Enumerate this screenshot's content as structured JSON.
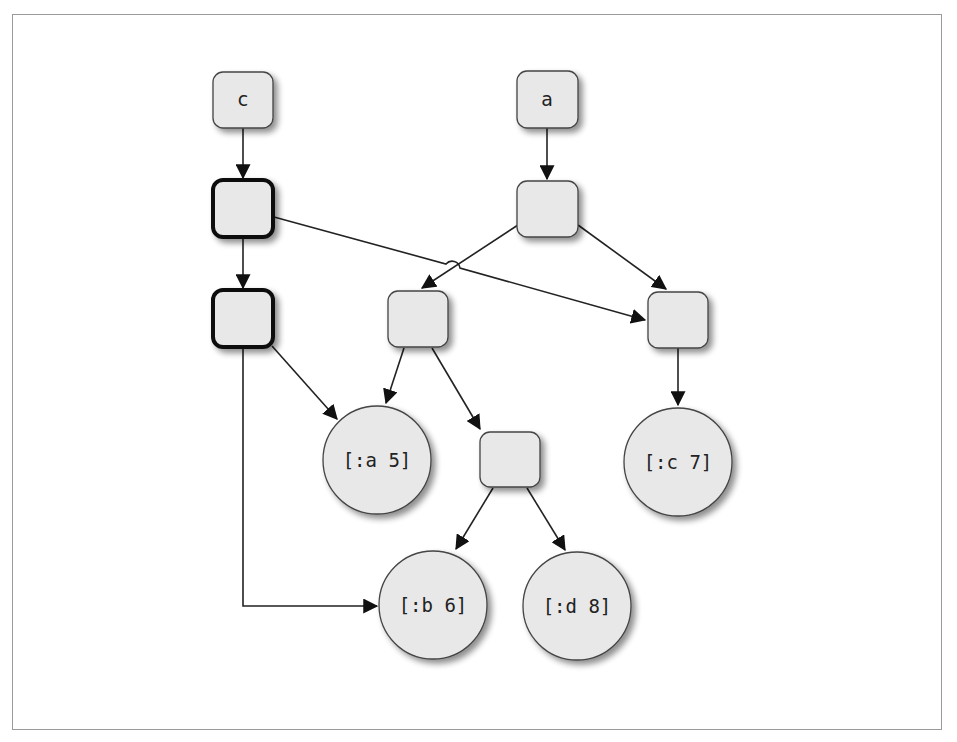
{
  "diagram": {
    "type": "persistent-data-structure-tree",
    "colors": {
      "node_fill": "#e8e8e8",
      "node_stroke": "#333333",
      "edge": "#222222",
      "frame": "#9a9a9a",
      "background": "#ffffff"
    },
    "roots": [
      {
        "id": "c",
        "label": "c"
      },
      {
        "id": "a",
        "label": "a"
      }
    ],
    "nodes": [
      {
        "id": "c",
        "shape": "box",
        "label": "c",
        "x": 213,
        "y": 72,
        "w": 60,
        "h": 56,
        "bold": false
      },
      {
        "id": "c1",
        "shape": "box",
        "label": "",
        "x": 213,
        "y": 180,
        "w": 60,
        "h": 57,
        "bold": true
      },
      {
        "id": "c2",
        "shape": "box",
        "label": "",
        "x": 213,
        "y": 290,
        "w": 60,
        "h": 57,
        "bold": true
      },
      {
        "id": "a",
        "shape": "box",
        "label": "a",
        "x": 517,
        "y": 71,
        "w": 61,
        "h": 57,
        "bold": false
      },
      {
        "id": "a1",
        "shape": "box",
        "label": "",
        "x": 517,
        "y": 181,
        "w": 61,
        "h": 56,
        "bold": false
      },
      {
        "id": "m",
        "shape": "box",
        "label": "",
        "x": 388,
        "y": 291,
        "w": 60,
        "h": 56,
        "bold": false
      },
      {
        "id": "r",
        "shape": "box",
        "label": "",
        "x": 648,
        "y": 292,
        "w": 60,
        "h": 56,
        "bold": false
      },
      {
        "id": "l",
        "shape": "box",
        "label": "",
        "x": 480,
        "y": 432,
        "w": 60,
        "h": 55,
        "bold": false
      },
      {
        "id": "a5",
        "shape": "circle",
        "label": "[:a 5]",
        "cx": 377,
        "cy": 460,
        "r": 54
      },
      {
        "id": "c7",
        "shape": "circle",
        "label": "[:c 7]",
        "cx": 678,
        "cy": 462,
        "r": 54
      },
      {
        "id": "b6",
        "shape": "circle",
        "label": "[:b 6]",
        "cx": 433,
        "cy": 605,
        "r": 54
      },
      {
        "id": "d8",
        "shape": "circle",
        "label": "[:d 8]",
        "cx": 577,
        "cy": 606,
        "r": 54
      }
    ],
    "edges": [
      {
        "from": "c",
        "to": "c1"
      },
      {
        "from": "c1",
        "to": "c2"
      },
      {
        "from": "c1",
        "to": "r",
        "note": "crosses a1->m edge with a hop"
      },
      {
        "from": "c2",
        "to": "a5"
      },
      {
        "from": "c2",
        "to": "b6",
        "routing": "orthogonal"
      },
      {
        "from": "a",
        "to": "a1"
      },
      {
        "from": "a1",
        "to": "m"
      },
      {
        "from": "a1",
        "to": "r"
      },
      {
        "from": "m",
        "to": "a5"
      },
      {
        "from": "m",
        "to": "l"
      },
      {
        "from": "r",
        "to": "c7"
      },
      {
        "from": "l",
        "to": "b6"
      },
      {
        "from": "l",
        "to": "d8"
      }
    ]
  },
  "labels": {
    "root_c": "c",
    "root_a": "a",
    "leaf_a5": "[:a 5]",
    "leaf_c7": "[:c 7]",
    "leaf_b6": "[:b 6]",
    "leaf_d8": "[:d 8]"
  }
}
